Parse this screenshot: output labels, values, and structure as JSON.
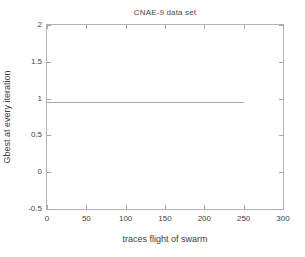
{
  "chart_data": {
    "type": "line",
    "title": "CNAE-9 data set",
    "xlabel": "traces flight of swarm",
    "ylabel": "Gbest at every iteration",
    "xlim": [
      0,
      300
    ],
    "ylim": [
      -0.5,
      2
    ],
    "xticks": [
      0,
      50,
      100,
      150,
      200,
      250,
      300
    ],
    "xtick_labels": [
      "0",
      "50",
      "100",
      "150",
      "200",
      "250",
      "300"
    ],
    "yticks": [
      -0.5,
      0,
      0.5,
      1,
      1.5,
      2
    ],
    "ytick_labels": [
      "-0.5",
      "0",
      "0.5",
      "1",
      "1.5",
      "2"
    ],
    "grid": false,
    "legend": null,
    "series": [
      {
        "name": "Gbest",
        "color": "#a8a8a8",
        "x": [
          0,
          25,
          50,
          75,
          100,
          125,
          150,
          175,
          200,
          225,
          250
        ],
        "values": [
          0.95,
          0.95,
          0.95,
          0.95,
          0.95,
          0.95,
          0.95,
          0.95,
          0.95,
          0.95,
          0.95
        ]
      }
    ],
    "annotations": []
  },
  "style": {
    "background": "#ffffff",
    "axis_color": "#b4b4b4",
    "tick_color": "#a5a5a5",
    "text_color": "#444444",
    "line_color": "#a8a8a8"
  }
}
